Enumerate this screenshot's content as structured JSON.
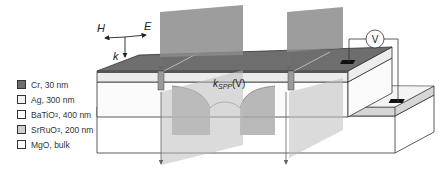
{
  "figure": {
    "axes_labels": {
      "h_field": "H",
      "e_field": "E",
      "wavevector": "k"
    },
    "wave_label": {
      "main": "k",
      "subscript": "SPP",
      "suffix": "(V)"
    },
    "voltmeter_label": "V"
  },
  "legend": {
    "items": [
      {
        "material": "Cr",
        "sub": "",
        "thickness": ", 30 nm",
        "color": "#6e6e6e"
      },
      {
        "material": "Ag",
        "sub": "",
        "thickness": ", 300 nm",
        "color": "#f2f2f2"
      },
      {
        "material": "BaTiO",
        "sub": "3",
        "thickness": ", 400 nm",
        "color": "#ffffff"
      },
      {
        "material": "SrRuO",
        "sub": "3",
        "thickness": ", 200 nm",
        "color": "#cfcfcf"
      },
      {
        "material": "MgO",
        "sub": "",
        "thickness": ", bulk",
        "color": "#ffffff"
      }
    ]
  },
  "colors": {
    "cr": "#6e6e6e",
    "ag": "#ececec",
    "bto": "#fbfbfb",
    "sro": "#d6d6d6",
    "mgo": "#ffffff",
    "beam": "#8c8c8c",
    "outline": "#333333"
  }
}
